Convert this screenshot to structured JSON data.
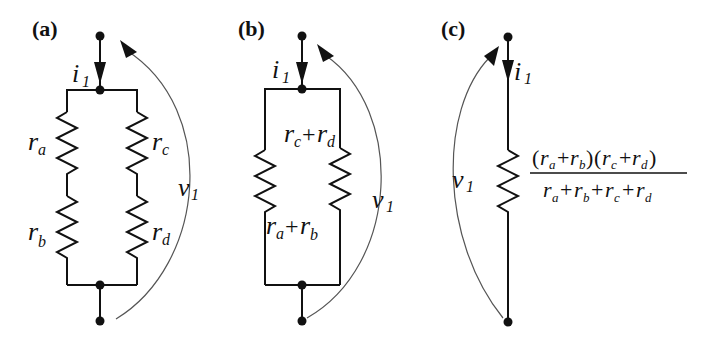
{
  "figure": {
    "panels": [
      {
        "id": "a",
        "label": "(a)",
        "current": {
          "symbol": "i",
          "sub": "1"
        },
        "voltage": {
          "symbol": "v",
          "sub": "1"
        },
        "resistors": [
          {
            "symbol": "r",
            "sub": "a"
          },
          {
            "symbol": "r",
            "sub": "b"
          },
          {
            "symbol": "r",
            "sub": "c"
          },
          {
            "symbol": "r",
            "sub": "d"
          }
        ]
      },
      {
        "id": "b",
        "label": "(b)",
        "current": {
          "symbol": "i",
          "sub": "1"
        },
        "voltage": {
          "symbol": "v",
          "sub": "1"
        },
        "resistors": [
          {
            "terms": [
              {
                "symbol": "r",
                "sub": "c"
              },
              {
                "symbol": "r",
                "sub": "d"
              }
            ],
            "op": "+"
          },
          {
            "terms": [
              {
                "symbol": "r",
                "sub": "a"
              },
              {
                "symbol": "r",
                "sub": "b"
              }
            ],
            "op": "+"
          }
        ]
      },
      {
        "id": "c",
        "label": "(c)",
        "current": {
          "symbol": "i",
          "sub": "1"
        },
        "voltage": {
          "symbol": "v",
          "sub": "1"
        },
        "equivalent": {
          "numerator": "(ra+rb)(rc+rd)",
          "denominator": "ra+rb+rc+rd",
          "lparen": "(",
          "rparen": ")",
          "plus": "+",
          "r": "r",
          "subs": {
            "a": "a",
            "b": "b",
            "c": "c",
            "d": "d"
          }
        }
      }
    ]
  }
}
